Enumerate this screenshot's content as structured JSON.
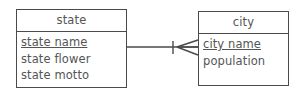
{
  "diagram": {
    "type": "entity-relationship-diagram",
    "notation": "crow's foot",
    "background_color": "#ffffff",
    "line_color": "#4a4a4a",
    "text_color": "#555555",
    "entities": [
      {
        "id": "state",
        "name": "state",
        "attributes": [
          {
            "label": "state name",
            "primary_key": true
          },
          {
            "label": "state flower",
            "primary_key": false
          },
          {
            "label": "state motto",
            "primary_key": false
          }
        ]
      },
      {
        "id": "city",
        "name": "city",
        "attributes": [
          {
            "label": "city name",
            "primary_key": true
          },
          {
            "label": "population",
            "primary_key": false
          }
        ]
      }
    ],
    "relationship": {
      "from": "state",
      "to": "city",
      "from_cardinality": "one",
      "to_cardinality": "many",
      "from_symbol": "single-tick",
      "to_symbol": "crows-foot"
    }
  }
}
